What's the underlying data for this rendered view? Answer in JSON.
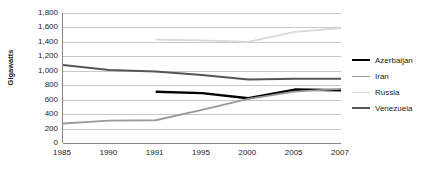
{
  "chart_data": {
    "type": "line",
    "title": "",
    "subtitle": "",
    "xlabel": "",
    "ylabel": "Gigawatts",
    "categories": [
      "1985",
      "1990",
      "1991",
      "1995",
      "2000",
      "2005",
      "2007"
    ],
    "ylim": [
      0,
      1800
    ],
    "y_ticks": [
      "1,800",
      "1,600",
      "1,400",
      "1,200",
      "1,000",
      "800",
      "600",
      "400",
      "200",
      "0"
    ],
    "y_tick_values": [
      1800,
      1600,
      1400,
      1200,
      1000,
      800,
      600,
      400,
      200,
      0
    ],
    "grid": true,
    "legend_position": "right",
    "series": [
      {
        "name": "Azerbaijan",
        "color": "#000000",
        "width": 2.4,
        "values": [
          null,
          null,
          710,
          690,
          620,
          740,
          730
        ]
      },
      {
        "name": "Iran",
        "color": "#9a9a9a",
        "width": 1.8,
        "values": [
          270,
          310,
          315,
          460,
          610,
          710,
          750
        ]
      },
      {
        "name": "Russia",
        "color": "#d8d8d8",
        "width": 1.8,
        "values": [
          null,
          null,
          1430,
          1420,
          1400,
          1540,
          1590
        ]
      },
      {
        "name": "Venezuela",
        "color": "#555555",
        "width": 2.0,
        "values": [
          1080,
          1010,
          990,
          940,
          880,
          890,
          890
        ]
      }
    ]
  },
  "legend": {
    "items": [
      {
        "label": "Azerbaijan",
        "color": "#000000",
        "width": 2.4
      },
      {
        "label": "Iran",
        "color": "#9a9a9a",
        "width": 1.8
      },
      {
        "label": "Russia",
        "color": "#d8d8d8",
        "width": 1.8
      },
      {
        "label": "Venezuela",
        "color": "#555555",
        "width": 2.0
      }
    ]
  },
  "colors": {
    "axis": "#868686",
    "grid": "#c9c9c9",
    "text": "#1a1a1a",
    "background": "#ffffff"
  }
}
